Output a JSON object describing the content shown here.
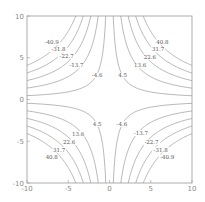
{
  "chart_data": {
    "type": "contour",
    "title": "",
    "xlabel": "",
    "ylabel": "",
    "xlim": [
      -10,
      10
    ],
    "ylim": [
      -10,
      10
    ],
    "grid": false,
    "function_hint": "f(x,y) = x*y (hyperbolic contours)",
    "x_ticks": [
      "-10",
      "-5",
      "0",
      "5",
      "10"
    ],
    "y_ticks": [
      "10",
      "5",
      "0",
      "-5",
      "-10"
    ],
    "positive_levels": [
      4.5,
      13.6,
      22.6,
      31.7,
      40.8
    ],
    "negative_levels": [
      -4.6,
      -13.7,
      -22.7,
      -31.8,
      -40.9
    ],
    "labels": {
      "upper_left": [
        "-40.9",
        "-31.8",
        "-22.7",
        "-13.7",
        "-4.6"
      ],
      "upper_right": [
        "40.8",
        "31.7",
        "22.6",
        "13.6",
        "4.5"
      ],
      "lower_left": [
        "4.5",
        "13.6",
        "22.6",
        "31.7",
        "40.8"
      ],
      "lower_right": [
        "-4.6",
        "-13.7",
        "-22.7",
        "-31.8",
        "-40.9"
      ]
    },
    "colors": {
      "line": "#9a9a9a",
      "label": "#555555",
      "background": "#ffffff"
    }
  }
}
